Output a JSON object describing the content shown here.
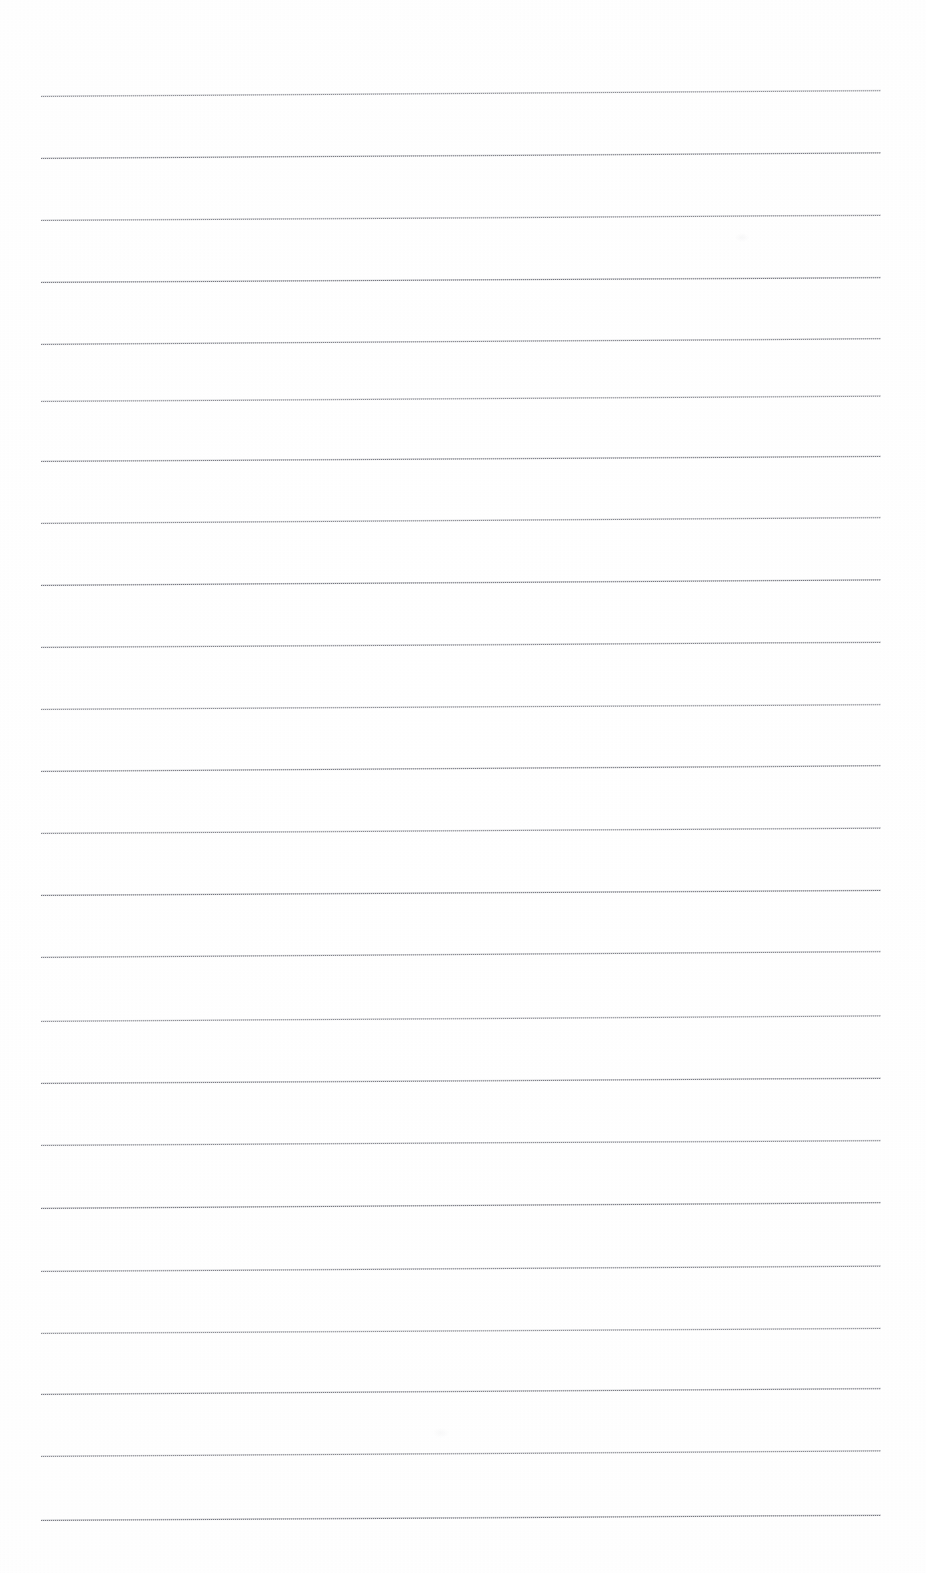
{
  "document": {
    "kind": "scanned-blank-ruled-page",
    "page_width": 926,
    "page_height": 1573,
    "background_color": "#fdfdfd",
    "has_text": false,
    "has_handwriting": false,
    "text_content": "",
    "notes_visible": "",
    "rule": {
      "color": "#8d8f98",
      "ink_core_color": "#464850",
      "line_count": 24,
      "left_x": 41,
      "right_x": 881,
      "line_length": 840,
      "first_line_y": 95,
      "spacing": 62,
      "tilt_degrees": -0.36,
      "thickness_px": 2
    },
    "line_y_positions": [
      95,
      157,
      219,
      281,
      343,
      400,
      460,
      522,
      584,
      646,
      708,
      770,
      832,
      894,
      956,
      1020,
      1082,
      1144,
      1207,
      1270,
      1332,
      1393,
      1455,
      1519
    ],
    "artifacts": [
      {
        "name": "faint-smudge-upper-right",
        "x": 735,
        "y": 233,
        "w": 14,
        "h": 9,
        "opacity": 0.05
      },
      {
        "name": "faint-smudge-lower-center",
        "x": 433,
        "y": 1428,
        "w": 16,
        "h": 10,
        "opacity": 0.045
      }
    ]
  }
}
